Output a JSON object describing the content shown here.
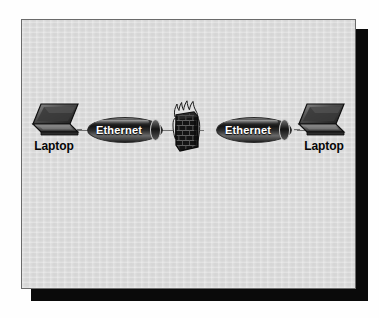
{
  "diagram": {
    "background_color": "#d9d9d9",
    "page_color": "#fefefe",
    "border_color": "#6b6b6b",
    "shadow_color": "#0a0a0a",
    "link_color": "#717171"
  },
  "nodes": [
    {
      "id": "laptop-left",
      "type": "laptop",
      "icon": "laptop-icon",
      "label": "Laptop"
    },
    {
      "id": "ethernet-left",
      "type": "ethernet-segment",
      "icon": "ethernet-bus-icon",
      "label": "Ethernet"
    },
    {
      "id": "firewall",
      "type": "firewall",
      "icon": "firewall-icon",
      "label": ""
    },
    {
      "id": "ethernet-right",
      "type": "ethernet-segment",
      "icon": "ethernet-bus-icon",
      "label": "Ethernet"
    },
    {
      "id": "laptop-right",
      "type": "laptop",
      "icon": "laptop-icon",
      "label": "Laptop"
    }
  ],
  "labels": {
    "laptop_left": "Laptop",
    "laptop_right": "Laptop",
    "ethernet_left": "Ethernet",
    "ethernet_right": "Ethernet"
  },
  "links": [
    {
      "from": "laptop-left",
      "to": "ethernet-left"
    },
    {
      "from": "ethernet-left",
      "to": "firewall"
    },
    {
      "from": "firewall",
      "to": "ethernet-right"
    },
    {
      "from": "ethernet-right",
      "to": "laptop-right"
    }
  ]
}
